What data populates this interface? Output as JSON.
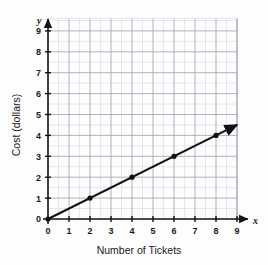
{
  "chart_data": {
    "type": "line",
    "title": "",
    "xlabel": "Number of Tickets",
    "ylabel": "Cost (dollars)",
    "x_axis_letter": "x",
    "y_axis_letter": "y",
    "xlim": [
      0,
      9
    ],
    "ylim": [
      0,
      9.6
    ],
    "xticks": [
      0,
      1,
      2,
      3,
      4,
      5,
      6,
      7,
      8,
      9
    ],
    "yticks": [
      0,
      1,
      2,
      3,
      4,
      5,
      6,
      7,
      8,
      9
    ],
    "xtick_labels": [
      "0",
      "1",
      "2",
      "3",
      "4",
      "5",
      "6",
      "7",
      "8",
      "9"
    ],
    "ytick_labels": [
      "0",
      "1",
      "2",
      "3",
      "4",
      "5",
      "6",
      "7",
      "8",
      "9"
    ],
    "grid": true,
    "grid_minor_step": 0.5,
    "legend": "none",
    "line_color": "#111111",
    "grid_color": "#9aa0ad",
    "grid_minor_color": "#d5d8e0",
    "axis_color": "#111111",
    "background_color": "#fdfdfe",
    "slope": 0.5,
    "intercept": 0,
    "line_start": {
      "x": 0,
      "y": 0
    },
    "line_end": {
      "x": 9,
      "y": 4.5
    },
    "arrow_end": true,
    "points": [
      {
        "x": 0,
        "y": 0
      },
      {
        "x": 2,
        "y": 1
      },
      {
        "x": 4,
        "y": 2
      },
      {
        "x": 6,
        "y": 3
      },
      {
        "x": 8,
        "y": 4
      }
    ],
    "series": [
      {
        "name": "Cost",
        "x": [
          0,
          2,
          4,
          6,
          8
        ],
        "values": [
          0,
          1,
          2,
          3,
          4
        ]
      }
    ]
  }
}
